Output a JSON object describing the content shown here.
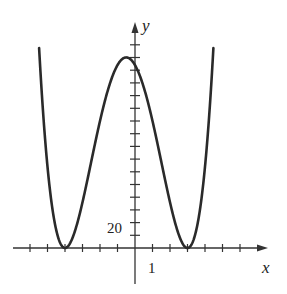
{
  "chart_data": {
    "type": "line",
    "title": "",
    "xlabel": "x",
    "ylabel": "y",
    "function": "y = (x+4)^2 (x-3)^2",
    "x_tick_label": "1",
    "y_tick_label": "20",
    "x_tick_step": 1,
    "y_tick_step": 10,
    "xlim": [
      -6,
      7.5
    ],
    "ylim": [
      -14,
      175
    ],
    "grid": false,
    "legend": "none",
    "key_points": [
      {
        "x": -4,
        "y": 0,
        "label": "local min"
      },
      {
        "x": 3,
        "y": 0,
        "label": "local min"
      },
      {
        "x": -0.5,
        "y": 150,
        "label": "local max"
      },
      {
        "x": 0,
        "y": 144,
        "label": "y-intercept"
      }
    ],
    "series": [
      {
        "name": "f(x)",
        "x": [
          -5.4,
          -5.2,
          -5,
          -4.8,
          -4.6,
          -4.4,
          -4.2,
          -4,
          -3.8,
          -3.6,
          -3.4,
          -3.2,
          -3,
          -2.8,
          -2.6,
          -2.4,
          -2.2,
          -2,
          -1.8,
          -1.6,
          -1.4,
          -1.2,
          -1,
          -0.8,
          -0.6,
          -0.4,
          -0.2,
          0,
          0.2,
          0.4,
          0.6,
          0.8,
          1,
          1.2,
          1.4,
          1.6,
          1.8,
          2,
          2.2,
          2.4,
          2.6,
          2.8,
          3,
          3.2,
          3.4,
          3.6,
          3.8,
          4,
          4.2,
          4.4,
          4.6
        ],
        "values": [
          138.3,
          102.8,
          64,
          39.3,
          20.4,
          8.0,
          1.8,
          0,
          1.7,
          6.6,
          14.3,
          23.8,
          36,
          49.8,
          64.5,
          79.4,
          93.9,
          108,
          121.2,
          133.2,
          143.4,
          144.0,
          144,
          148.2,
          149.9,
          149.9,
          148.2,
          144,
          138.3,
          130.7,
          121.7,
          111.1,
          100,
          87.6,
          74.9,
          62.0,
          49.3,
          36,
          24.4,
          15.0,
          7.4,
          2.4,
          0,
          1.7,
          7.8,
          18.6,
          34.8,
          49,
          75.7,
          103.0,
          141.6
        ]
      }
    ]
  },
  "labels": {
    "x_axis": "x",
    "y_axis": "y",
    "x_tick": "1",
    "y_tick": "20"
  }
}
